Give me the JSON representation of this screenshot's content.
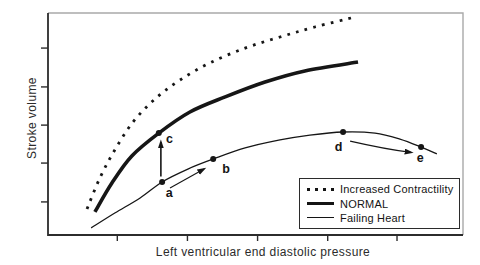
{
  "figure": {
    "y_axis_label": "Stroke volume",
    "x_axis_label": "Left ventricular end diastolic pressure"
  },
  "colors": {
    "background": "#ffffff",
    "ink": "#161616",
    "frame_gray": "#a9a9a9",
    "axis": "#2c2c2c"
  },
  "legend": {
    "items": [
      {
        "label": "Increased Contractility",
        "style": "dotted"
      },
      {
        "label": "NORMAL",
        "style": "thick"
      },
      {
        "label": "Failing Heart",
        "style": "thin"
      }
    ]
  },
  "chart_data": {
    "type": "line",
    "title": "",
    "xlabel": "Left ventricular end diastolic pressure",
    "ylabel": "Stroke volume",
    "axis_numbers_shown": false,
    "coordinate_units": "percent of plot area from bottom-left (figure prints no numeric scale)",
    "x_ticks_frac": [
      0.167,
      0.336,
      0.505,
      0.674,
      0.841
    ],
    "y_ticks_frac": [
      0.149,
      0.324,
      0.495,
      0.667,
      0.842
    ],
    "series": [
      {
        "id": "increased-contractility",
        "name": "Increased Contractility",
        "line_style": "dotted",
        "points": [
          [
            9.4,
            11.7
          ],
          [
            12.5,
            25.7
          ],
          [
            16.1,
            38.3
          ],
          [
            20.5,
            50.9
          ],
          [
            25.8,
            61.3
          ],
          [
            31.8,
            69.8
          ],
          [
            39.0,
            77.5
          ],
          [
            47.5,
            84.2
          ],
          [
            55.9,
            89.2
          ],
          [
            64.3,
            93.7
          ],
          [
            74.0,
            98.2
          ]
        ]
      },
      {
        "id": "normal",
        "name": "NORMAL",
        "line_style": "thick",
        "points": [
          [
            11.3,
            10.4
          ],
          [
            15.4,
            23.4
          ],
          [
            20.2,
            35.6
          ],
          [
            26.7,
            45.9
          ],
          [
            34.2,
            55.4
          ],
          [
            42.7,
            62.2
          ],
          [
            52.3,
            68.9
          ],
          [
            61.9,
            73.9
          ],
          [
            74.7,
            77.9
          ]
        ]
      },
      {
        "id": "failing-heart",
        "name": "Failing Heart",
        "line_style": "thin",
        "points": [
          [
            10.4,
            3.2
          ],
          [
            16.1,
            9.9
          ],
          [
            22.2,
            16.7
          ],
          [
            27.5,
            23.9
          ],
          [
            33.7,
            29.7
          ],
          [
            39.8,
            34.2
          ],
          [
            47.5,
            39.2
          ],
          [
            55.9,
            42.8
          ],
          [
            63.1,
            45.0
          ],
          [
            71.1,
            46.4
          ],
          [
            78.8,
            45.9
          ],
          [
            84.8,
            43.2
          ],
          [
            89.9,
            39.6
          ],
          [
            93.7,
            36.5
          ]
        ]
      }
    ],
    "marked_points": [
      {
        "label": "a",
        "on_series": "failing-heart",
        "x": 27.5,
        "y": 23.9,
        "label_x": 29.2,
        "label_y": 19.0
      },
      {
        "label": "b",
        "on_series": "failing-heart",
        "x": 39.8,
        "y": 34.2,
        "label_x": 42.9,
        "label_y": 30.0
      },
      {
        "label": "c",
        "on_series": "normal",
        "x": 26.7,
        "y": 45.9,
        "label_x": 29.3,
        "label_y": 43.5
      },
      {
        "label": "d",
        "on_series": "failing-heart",
        "x": 71.1,
        "y": 46.4,
        "label_x": 70.0,
        "label_y": 39.9
      },
      {
        "label": "e",
        "on_series": "failing-heart",
        "x": 89.9,
        "y": 39.6,
        "label_x": 89.7,
        "label_y": 34.6
      }
    ],
    "arrows": [
      {
        "id": "a-to-c",
        "from": [
          27.2,
          26.4
        ],
        "to": [
          27.2,
          41.9
        ],
        "weight": "medium"
      },
      {
        "id": "a-to-b",
        "from": [
          29.4,
          21.2
        ],
        "to": [
          37.6,
          29.7
        ],
        "weight": "thin"
      },
      {
        "id": "d-to-e",
        "from": [
          72.8,
          42.3
        ],
        "ctrl": [
          81.2,
          38.7
        ],
        "to": [
          87.5,
          37.2
        ],
        "weight": "thin"
      }
    ]
  }
}
